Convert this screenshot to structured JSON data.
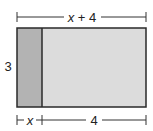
{
  "diagram": {
    "type": "area-model-rectangle",
    "labels": {
      "top_width": "x + 4",
      "left_height": "3",
      "bottom_left_width": "x",
      "bottom_right_width": "4"
    },
    "top_width_parts": {
      "var": "x",
      "op": " + ",
      "num": "4"
    },
    "regions": [
      {
        "name": "left-region",
        "width_label": "x",
        "height_label": "3",
        "color": "#b3b3b3"
      },
      {
        "name": "right-region",
        "width_label": "4",
        "height_label": "3",
        "color": "#dcdcdc"
      }
    ],
    "colors": {
      "stroke": "#2a2a2a",
      "dimension_line": "#333333",
      "left_fill": "#b3b3b3",
      "right_fill": "#dcdcdc"
    }
  }
}
